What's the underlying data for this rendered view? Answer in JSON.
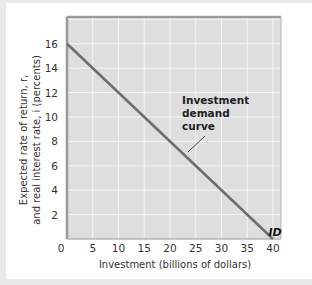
{
  "chart_data": {
    "type": "line",
    "title": "",
    "xlabel": "Investment (billions of dollars)",
    "ylabel_line1": "Expected rate of return, r,",
    "ylabel_line2": "and real interest rate, i (percents)",
    "xlim": [
      0,
      42
    ],
    "ylim": [
      0,
      18
    ],
    "x_ticks": [
      0,
      5,
      10,
      15,
      20,
      25,
      30,
      35,
      40
    ],
    "y_ticks": [
      2,
      4,
      6,
      8,
      10,
      12,
      14,
      16
    ],
    "grid": true,
    "series": [
      {
        "name": "ID",
        "x": [
          0,
          40
        ],
        "y": [
          16,
          0
        ]
      }
    ],
    "annotations": [
      {
        "text_lines": [
          "Investment",
          "demand",
          "curve"
        ],
        "points_to": [
          23,
          7
        ]
      },
      {
        "text": "ID",
        "position": [
          40,
          0.8
        ]
      }
    ],
    "colors": {
      "plot_bg": "#dedede",
      "grid": "#f4f4f4",
      "line": "#6e6e6e",
      "border": "#9a9a9a"
    }
  }
}
